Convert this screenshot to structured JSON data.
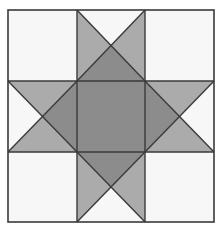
{
  "diagram": {
    "title": "",
    "type": "quilt-block-sawtooth-star",
    "grid": {
      "rows": 3,
      "cols": 3,
      "x_lines": [
        8,
        77,
        145,
        214
      ],
      "y_lines": [
        10,
        81,
        152,
        222
      ]
    },
    "colors": {
      "white": "#f7f7f7",
      "mid": "#ababab",
      "dark": "#8c8c8c",
      "line": "#3a3a3a"
    },
    "cells": [
      {
        "row": 0,
        "col": 0,
        "kind": "plain",
        "fill": "white"
      },
      {
        "row": 0,
        "col": 1,
        "kind": "quarter-square",
        "top": "white",
        "left": "mid",
        "right": "mid",
        "bottom": "dark"
      },
      {
        "row": 0,
        "col": 2,
        "kind": "plain",
        "fill": "white"
      },
      {
        "row": 1,
        "col": 0,
        "kind": "quarter-square",
        "top": "mid",
        "left": "white",
        "right": "dark",
        "bottom": "mid"
      },
      {
        "row": 1,
        "col": 1,
        "kind": "plain",
        "fill": "dark"
      },
      {
        "row": 1,
        "col": 2,
        "kind": "quarter-square",
        "top": "mid",
        "left": "dark",
        "right": "white",
        "bottom": "mid"
      },
      {
        "row": 2,
        "col": 0,
        "kind": "plain",
        "fill": "white"
      },
      {
        "row": 2,
        "col": 1,
        "kind": "quarter-square",
        "top": "dark",
        "left": "mid",
        "right": "mid",
        "bottom": "white"
      },
      {
        "row": 2,
        "col": 2,
        "kind": "plain",
        "fill": "white"
      }
    ]
  }
}
